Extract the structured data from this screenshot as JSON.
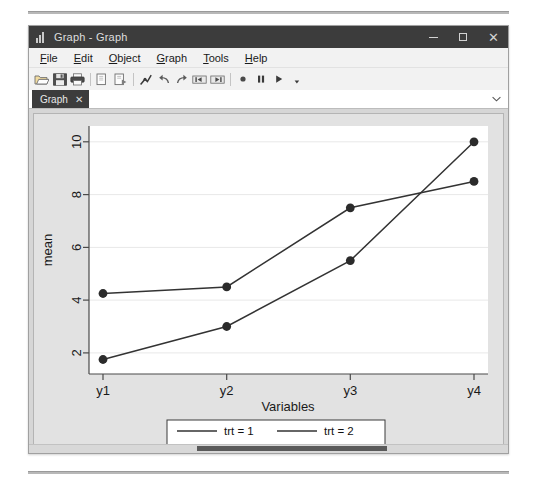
{
  "window": {
    "title": "Graph - Graph",
    "app_icon": "bar-chart-icon",
    "controls": {
      "minimize": "–",
      "maximize": "□",
      "close": "✕"
    }
  },
  "menu": {
    "items": [
      {
        "label": "File",
        "mnemonic": "F"
      },
      {
        "label": "Edit",
        "mnemonic": "E"
      },
      {
        "label": "Object",
        "mnemonic": "O"
      },
      {
        "label": "Graph",
        "mnemonic": "G"
      },
      {
        "label": "Tools",
        "mnemonic": "T"
      },
      {
        "label": "Help",
        "mnemonic": "H"
      }
    ]
  },
  "toolbar": {
    "buttons": [
      {
        "name": "open-icon",
        "title": "Open"
      },
      {
        "name": "save-icon",
        "title": "Save"
      },
      {
        "name": "print-icon",
        "title": "Print"
      },
      {
        "name": "copy-icon",
        "title": "Copy"
      },
      {
        "name": "paste-icon",
        "title": "Paste"
      },
      {
        "name": "graph-editor-icon",
        "title": "Start Graph Editor"
      },
      {
        "name": "undo-icon",
        "title": "Undo"
      },
      {
        "name": "redo-icon",
        "title": "Redo"
      },
      {
        "name": "prev-graph-icon",
        "title": "Previous graph"
      },
      {
        "name": "next-graph-icon",
        "title": "Next graph"
      },
      {
        "name": "record-icon",
        "title": "Record"
      },
      {
        "name": "pause-icon",
        "title": "Pause"
      },
      {
        "name": "play-icon",
        "title": "Play"
      },
      {
        "name": "play-dropdown-icon",
        "title": "Play options"
      }
    ]
  },
  "tabs": {
    "items": [
      {
        "label": "Graph",
        "close": "✕",
        "active": true
      }
    ],
    "overflow_icon": "chevron-down-icon"
  },
  "chart_data": {
    "type": "line",
    "title": "",
    "xlabel": "Variables",
    "ylabel": "mean",
    "categories": [
      "y1",
      "y2",
      "y3",
      "y4"
    ],
    "yticks": [
      2,
      4,
      6,
      8,
      10
    ],
    "ylim": [
      1.2,
      10.6
    ],
    "grid": true,
    "grid_color": "#e8e8e8",
    "plot_bg": "#ffffff",
    "line_color": "#333333",
    "marker_color": "#2b2b2b",
    "marker": "circle",
    "series": [
      {
        "name": "trt = 1",
        "values": [
          4.25,
          4.5,
          7.5,
          8.5
        ]
      },
      {
        "name": "trt = 2",
        "values": [
          1.75,
          3.0,
          5.5,
          10.0
        ]
      }
    ],
    "legend": {
      "position": "bottom",
      "entries": [
        {
          "label": "trt = 1",
          "marker": "line"
        },
        {
          "label": "trt = 2",
          "marker": "line"
        },
        {
          "label": "mean",
          "marker": "dot"
        }
      ]
    }
  }
}
